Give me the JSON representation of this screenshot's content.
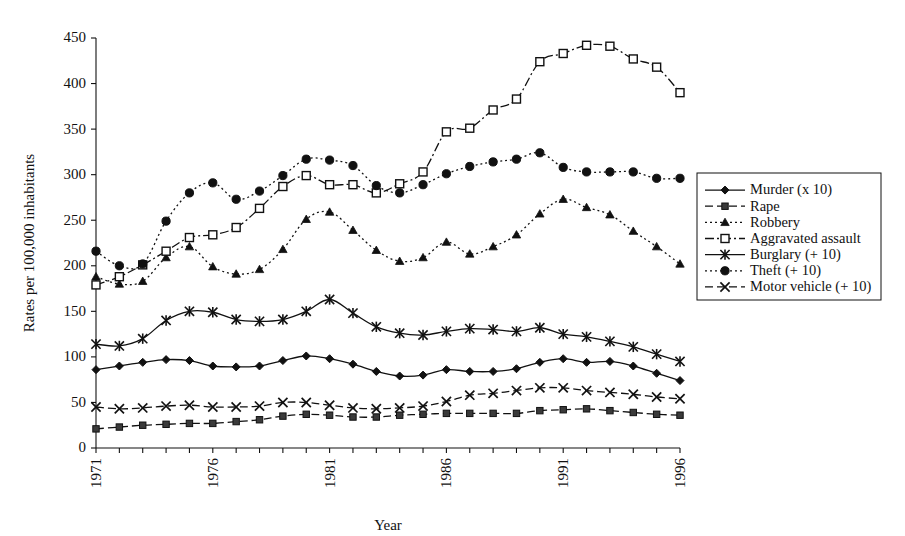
{
  "chart_data": {
    "type": "line",
    "title": "",
    "xlabel": "Year",
    "ylabel": "Rates per 100,000 inhabitants",
    "xlim": [
      1971,
      1996
    ],
    "ylim": [
      0,
      450
    ],
    "ytick_values": [
      0,
      50,
      100,
      150,
      200,
      250,
      300,
      350,
      400,
      450
    ],
    "ytick_labels": [
      "0",
      "50",
      "100",
      "150",
      "200",
      "250",
      "300",
      "350",
      "400",
      "450"
    ],
    "xtick_values": [
      1971,
      1976,
      1981,
      1986,
      1991,
      1996
    ],
    "xtick_labels": [
      "1971",
      "1976",
      "1981",
      "1986",
      "1991",
      "1996"
    ],
    "x_minor_ticks_every": 1,
    "grid": false,
    "legend_position": "right-outside",
    "x": [
      1971,
      1972,
      1973,
      1974,
      1975,
      1976,
      1977,
      1978,
      1979,
      1980,
      1981,
      1982,
      1983,
      1984,
      1985,
      1986,
      1987,
      1988,
      1989,
      1990,
      1991,
      1992,
      1993,
      1994,
      1995,
      1996
    ],
    "series": [
      {
        "name": "Murder (x 10)",
        "label": "Murder (x 10)",
        "marker": "diamond",
        "dash": "solid",
        "values": [
          86,
          90,
          94,
          97,
          96,
          90,
          89,
          90,
          96,
          101,
          98,
          92,
          84,
          79,
          80,
          86,
          84,
          84,
          87,
          94,
          98,
          94,
          95,
          90,
          82,
          74
        ]
      },
      {
        "name": "Rape",
        "label": "Rape",
        "marker": "square-filled",
        "dash": "dashed",
        "values": [
          21,
          23,
          25,
          26,
          27,
          27,
          29,
          31,
          35,
          37,
          36,
          34,
          34,
          36,
          37,
          38,
          38,
          38,
          38,
          41,
          42,
          43,
          41,
          39,
          37,
          36
        ]
      },
      {
        "name": "Robbery",
        "label": "Robbery",
        "marker": "triangle",
        "dash": "dotted",
        "values": [
          188,
          180,
          183,
          209,
          221,
          199,
          191,
          196,
          218,
          251,
          259,
          239,
          217,
          205,
          209,
          226,
          213,
          221,
          234,
          257,
          273,
          264,
          256,
          238,
          221,
          202
        ]
      },
      {
        "name": "Aggravated assault",
        "label": "Aggravated assault",
        "marker": "square-open",
        "dash": "dashdot",
        "values": [
          179,
          188,
          201,
          216,
          231,
          234,
          242,
          263,
          287,
          299,
          289,
          289,
          280,
          290,
          303,
          347,
          351,
          371,
          383,
          424,
          433,
          442,
          441,
          427,
          418,
          390
        ]
      },
      {
        "name": "Burglary (+ 10)",
        "label": "Burglary (+ 10)",
        "marker": "star",
        "dash": "solid",
        "values": [
          114,
          112,
          120,
          140,
          150,
          149,
          141,
          139,
          141,
          150,
          163,
          148,
          133,
          126,
          124,
          128,
          131,
          130,
          128,
          132,
          125,
          122,
          117,
          111,
          103,
          95
        ]
      },
      {
        "name": "Theft (+ 10)",
        "label": "Theft (+ 10)",
        "marker": "circle",
        "dash": "dotted",
        "values": [
          216,
          200,
          202,
          249,
          280,
          291,
          273,
          282,
          299,
          317,
          316,
          310,
          288,
          280,
          289,
          301,
          309,
          314,
          317,
          324,
          308,
          303,
          303,
          303,
          296,
          296
        ]
      },
      {
        "name": "Motor vehicle (+ 10)",
        "label": "Motor vehicle (+ 10)",
        "marker": "x",
        "dash": "dashed",
        "values": [
          45,
          43,
          44,
          46,
          47,
          45,
          45,
          46,
          50,
          50,
          47,
          44,
          43,
          44,
          46,
          51,
          58,
          60,
          63,
          66,
          66,
          63,
          61,
          59,
          56,
          54
        ]
      }
    ]
  },
  "legend": {
    "entries": [
      {
        "label": "Murder (x 10)"
      },
      {
        "label": "Rape"
      },
      {
        "label": "Robbery"
      },
      {
        "label": "Aggravated assault"
      },
      {
        "label": "Burglary (+ 10)"
      },
      {
        "label": "Theft (+ 10)"
      },
      {
        "label": "Motor vehicle (+ 10)"
      }
    ]
  },
  "colors": {
    "ink": "#111111",
    "background": "#ffffff"
  }
}
